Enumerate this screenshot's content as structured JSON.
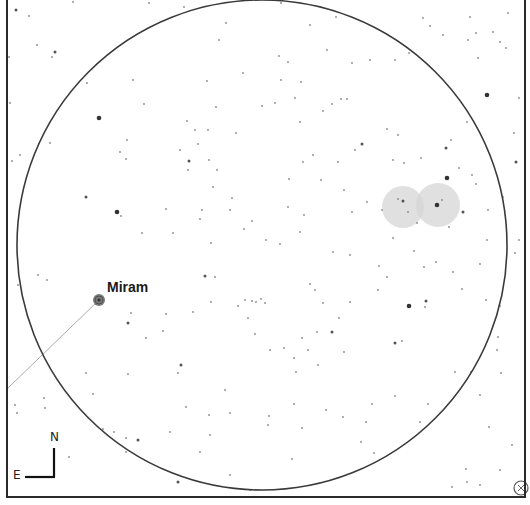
{
  "chart": {
    "width": 530,
    "height": 505,
    "frame": {
      "left": 7,
      "top": -2,
      "right": 525,
      "bottom": 497,
      "color": "#2a2a2a"
    },
    "field_circle": {
      "cx": 262,
      "cy": 245,
      "r": 245,
      "color": "#3a3a3a"
    },
    "background": "#ffffff"
  },
  "labels": {
    "named_star": "Miram",
    "compass_north": "N",
    "compass_east": "E"
  },
  "named_star": {
    "name": "Miram",
    "x": 99,
    "y": 300,
    "r": 6,
    "label_x": 107,
    "label_y": 279
  },
  "pointer_line": {
    "x1": 99,
    "y1": 300,
    "x2": 8,
    "y2": 388,
    "color": "#aaaaaa"
  },
  "nebulae": [
    {
      "cx": 403,
      "cy": 207,
      "r": 21,
      "color": "#d6d6d6"
    },
    {
      "cx": 438,
      "cy": 205,
      "r": 22,
      "color": "#d6d6d6"
    }
  ],
  "compass": {
    "corner_x": 54,
    "corner_y": 477,
    "north_len": 29,
    "east_len": 29,
    "label_n_x": 50,
    "label_n_y": 430,
    "label_e_x": 13,
    "label_e_y": 468
  },
  "corner_icon": {
    "name": "crosshair-icon",
    "cx": 521,
    "cy": 488,
    "r": 7
  },
  "stars": [
    {
      "x": 16,
      "y": 10,
      "m": 2
    },
    {
      "x": 29,
      "y": 16,
      "m": 1
    },
    {
      "x": 73,
      "y": 2,
      "m": 1
    },
    {
      "x": 37,
      "y": 45,
      "m": 1
    },
    {
      "x": 55,
      "y": 52,
      "m": 2
    },
    {
      "x": 52,
      "y": 57,
      "m": 1
    },
    {
      "x": 9,
      "y": 57,
      "m": 1
    },
    {
      "x": 87,
      "y": 83,
      "m": 1
    },
    {
      "x": 10,
      "y": 103,
      "m": 1
    },
    {
      "x": 50,
      "y": 143,
      "m": 1
    },
    {
      "x": 20,
      "y": 155,
      "m": 1
    },
    {
      "x": 12,
      "y": 161,
      "m": 1
    },
    {
      "x": 99,
      "y": 118,
      "m": 3
    },
    {
      "x": 133,
      "y": 80,
      "m": 1
    },
    {
      "x": 144,
      "y": 104,
      "m": 1
    },
    {
      "x": 127,
      "y": 140,
      "m": 1
    },
    {
      "x": 120,
      "y": 152,
      "m": 1
    },
    {
      "x": 126,
      "y": 159,
      "m": 1
    },
    {
      "x": 117,
      "y": 212,
      "m": 3
    },
    {
      "x": 86,
      "y": 197,
      "m": 2
    },
    {
      "x": 121,
      "y": 216,
      "m": 1
    },
    {
      "x": 142,
      "y": 233,
      "m": 1
    },
    {
      "x": 166,
      "y": 209,
      "m": 1
    },
    {
      "x": 173,
      "y": 233,
      "m": 1
    },
    {
      "x": 187,
      "y": 121,
      "m": 1
    },
    {
      "x": 195,
      "y": 130,
      "m": 1
    },
    {
      "x": 180,
      "y": 150,
      "m": 1
    },
    {
      "x": 189,
      "y": 161,
      "m": 2
    },
    {
      "x": 198,
      "y": 144,
      "m": 1
    },
    {
      "x": 188,
      "y": 170,
      "m": 1
    },
    {
      "x": 209,
      "y": 160,
      "m": 1
    },
    {
      "x": 217,
      "y": 170,
      "m": 1
    },
    {
      "x": 213,
      "y": 187,
      "m": 1
    },
    {
      "x": 202,
      "y": 210,
      "m": 1
    },
    {
      "x": 230,
      "y": 210,
      "m": 1
    },
    {
      "x": 232,
      "y": 198,
      "m": 1
    },
    {
      "x": 200,
      "y": 219,
      "m": 1
    },
    {
      "x": 244,
      "y": 229,
      "m": 1
    },
    {
      "x": 211,
      "y": 243,
      "m": 1
    },
    {
      "x": 252,
      "y": 221,
      "m": 1
    },
    {
      "x": 266,
      "y": 240,
      "m": 1
    },
    {
      "x": 208,
      "y": 130,
      "m": 1
    },
    {
      "x": 236,
      "y": 133,
      "m": 1
    },
    {
      "x": 262,
      "y": 106,
      "m": 1
    },
    {
      "x": 275,
      "y": 103,
      "m": 1
    },
    {
      "x": 295,
      "y": 98,
      "m": 1
    },
    {
      "x": 301,
      "y": 82,
      "m": 1
    },
    {
      "x": 288,
      "y": 62,
      "m": 1
    },
    {
      "x": 279,
      "y": 56,
      "m": 1
    },
    {
      "x": 281,
      "y": 80,
      "m": 1
    },
    {
      "x": 300,
      "y": 122,
      "m": 1
    },
    {
      "x": 327,
      "y": 50,
      "m": 1
    },
    {
      "x": 341,
      "y": 99,
      "m": 1
    },
    {
      "x": 347,
      "y": 99,
      "m": 1
    },
    {
      "x": 323,
      "y": 111,
      "m": 1
    },
    {
      "x": 332,
      "y": 104,
      "m": 1
    },
    {
      "x": 313,
      "y": 155,
      "m": 1
    },
    {
      "x": 303,
      "y": 162,
      "m": 1
    },
    {
      "x": 355,
      "y": 150,
      "m": 1
    },
    {
      "x": 338,
      "y": 162,
      "m": 1
    },
    {
      "x": 321,
      "y": 180,
      "m": 1
    },
    {
      "x": 362,
      "y": 144,
      "m": 2
    },
    {
      "x": 387,
      "y": 129,
      "m": 1
    },
    {
      "x": 398,
      "y": 135,
      "m": 1
    },
    {
      "x": 393,
      "y": 160,
      "m": 1
    },
    {
      "x": 404,
      "y": 163,
      "m": 1
    },
    {
      "x": 421,
      "y": 158,
      "m": 1
    },
    {
      "x": 446,
      "y": 148,
      "m": 2
    },
    {
      "x": 447,
      "y": 178,
      "m": 3
    },
    {
      "x": 459,
      "y": 168,
      "m": 1
    },
    {
      "x": 487,
      "y": 95,
      "m": 3
    },
    {
      "x": 516,
      "y": 162,
      "m": 2
    },
    {
      "x": 472,
      "y": 175,
      "m": 1
    },
    {
      "x": 488,
      "y": 210,
      "m": 1
    },
    {
      "x": 476,
      "y": 184,
      "m": 1
    },
    {
      "x": 503,
      "y": 197,
      "m": 1
    },
    {
      "x": 352,
      "y": 63,
      "m": 1
    },
    {
      "x": 370,
      "y": 60,
      "m": 1
    },
    {
      "x": 395,
      "y": 60,
      "m": 1
    },
    {
      "x": 409,
      "y": 53,
      "m": 1
    },
    {
      "x": 423,
      "y": 18,
      "m": 1
    },
    {
      "x": 430,
      "y": 26,
      "m": 1
    },
    {
      "x": 443,
      "y": 35,
      "m": 1
    },
    {
      "x": 470,
      "y": 17,
      "m": 1
    },
    {
      "x": 468,
      "y": 40,
      "m": 1
    },
    {
      "x": 478,
      "y": 58,
      "m": 1
    },
    {
      "x": 500,
      "y": 42,
      "m": 1
    },
    {
      "x": 506,
      "y": 48,
      "m": 1
    },
    {
      "x": 508,
      "y": 13,
      "m": 1
    },
    {
      "x": 493,
      "y": 32,
      "m": 1
    },
    {
      "x": 476,
      "y": 33,
      "m": 1
    },
    {
      "x": 281,
      "y": 3,
      "m": 1
    },
    {
      "x": 310,
      "y": 25,
      "m": 1
    },
    {
      "x": 336,
      "y": 17,
      "m": 1
    },
    {
      "x": 184,
      "y": 7,
      "m": 1
    },
    {
      "x": 149,
      "y": 3,
      "m": 1
    },
    {
      "x": 207,
      "y": 81,
      "m": 1
    },
    {
      "x": 216,
      "y": 107,
      "m": 1
    },
    {
      "x": 243,
      "y": 73,
      "m": 1
    },
    {
      "x": 219,
      "y": 40,
      "m": 1
    },
    {
      "x": 226,
      "y": 23,
      "m": 1
    },
    {
      "x": 403,
      "y": 201,
      "m": 2
    },
    {
      "x": 408,
      "y": 212,
      "m": 1
    },
    {
      "x": 398,
      "y": 199,
      "m": 1
    },
    {
      "x": 437,
      "y": 205,
      "m": 3
    },
    {
      "x": 442,
      "y": 200,
      "m": 1
    },
    {
      "x": 463,
      "y": 212,
      "m": 2
    },
    {
      "x": 449,
      "y": 227,
      "m": 1
    },
    {
      "x": 417,
      "y": 223,
      "m": 1
    },
    {
      "x": 382,
      "y": 210,
      "m": 1
    },
    {
      "x": 367,
      "y": 202,
      "m": 1
    },
    {
      "x": 352,
      "y": 212,
      "m": 1
    },
    {
      "x": 344,
      "y": 190,
      "m": 1
    },
    {
      "x": 304,
      "y": 215,
      "m": 1
    },
    {
      "x": 288,
      "y": 207,
      "m": 1
    },
    {
      "x": 289,
      "y": 179,
      "m": 1
    },
    {
      "x": 300,
      "y": 232,
      "m": 1
    },
    {
      "x": 280,
      "y": 244,
      "m": 1
    },
    {
      "x": 393,
      "y": 238,
      "m": 1
    },
    {
      "x": 414,
      "y": 251,
      "m": 1
    },
    {
      "x": 424,
      "y": 267,
      "m": 1
    },
    {
      "x": 436,
      "y": 262,
      "m": 1
    },
    {
      "x": 453,
      "y": 272,
      "m": 1
    },
    {
      "x": 462,
      "y": 289,
      "m": 1
    },
    {
      "x": 480,
      "y": 264,
      "m": 1
    },
    {
      "x": 487,
      "y": 240,
      "m": 1
    },
    {
      "x": 409,
      "y": 306,
      "m": 3
    },
    {
      "x": 426,
      "y": 301,
      "m": 2
    },
    {
      "x": 425,
      "y": 307,
      "m": 1
    },
    {
      "x": 395,
      "y": 343,
      "m": 2
    },
    {
      "x": 402,
      "y": 341,
      "m": 1
    },
    {
      "x": 387,
      "y": 277,
      "m": 1
    },
    {
      "x": 379,
      "y": 266,
      "m": 1
    },
    {
      "x": 378,
      "y": 290,
      "m": 1
    },
    {
      "x": 350,
      "y": 255,
      "m": 1
    },
    {
      "x": 333,
      "y": 252,
      "m": 1
    },
    {
      "x": 310,
      "y": 284,
      "m": 1
    },
    {
      "x": 315,
      "y": 290,
      "m": 1
    },
    {
      "x": 323,
      "y": 303,
      "m": 1
    },
    {
      "x": 332,
      "y": 332,
      "m": 2
    },
    {
      "x": 317,
      "y": 332,
      "m": 1
    },
    {
      "x": 302,
      "y": 338,
      "m": 1
    },
    {
      "x": 308,
      "y": 350,
      "m": 1
    },
    {
      "x": 294,
      "y": 358,
      "m": 1
    },
    {
      "x": 284,
      "y": 348,
      "m": 1
    },
    {
      "x": 296,
      "y": 372,
      "m": 1
    },
    {
      "x": 318,
      "y": 365,
      "m": 1
    },
    {
      "x": 344,
      "y": 352,
      "m": 1
    },
    {
      "x": 350,
      "y": 302,
      "m": 1
    },
    {
      "x": 339,
      "y": 318,
      "m": 1
    },
    {
      "x": 270,
      "y": 350,
      "m": 1
    },
    {
      "x": 245,
      "y": 300,
      "m": 1
    },
    {
      "x": 252,
      "y": 301,
      "m": 1
    },
    {
      "x": 256,
      "y": 302,
      "m": 1
    },
    {
      "x": 261,
      "y": 299,
      "m": 1
    },
    {
      "x": 265,
      "y": 303,
      "m": 1
    },
    {
      "x": 238,
      "y": 306,
      "m": 1
    },
    {
      "x": 248,
      "y": 318,
      "m": 1
    },
    {
      "x": 255,
      "y": 334,
      "m": 1
    },
    {
      "x": 215,
      "y": 277,
      "m": 1
    },
    {
      "x": 205,
      "y": 276,
      "m": 2
    },
    {
      "x": 211,
      "y": 302,
      "m": 1
    },
    {
      "x": 193,
      "y": 312,
      "m": 1
    },
    {
      "x": 166,
      "y": 314,
      "m": 1
    },
    {
      "x": 131,
      "y": 313,
      "m": 1
    },
    {
      "x": 128,
      "y": 323,
      "m": 2
    },
    {
      "x": 163,
      "y": 331,
      "m": 1
    },
    {
      "x": 146,
      "y": 338,
      "m": 1
    },
    {
      "x": 181,
      "y": 365,
      "m": 2
    },
    {
      "x": 178,
      "y": 373,
      "m": 1
    },
    {
      "x": 128,
      "y": 374,
      "m": 1
    },
    {
      "x": 93,
      "y": 394,
      "m": 1
    },
    {
      "x": 86,
      "y": 373,
      "m": 1
    },
    {
      "x": 44,
      "y": 398,
      "m": 1
    },
    {
      "x": 47,
      "y": 280,
      "m": 1
    },
    {
      "x": 38,
      "y": 275,
      "m": 1
    },
    {
      "x": 18,
      "y": 285,
      "m": 1
    },
    {
      "x": 15,
      "y": 405,
      "m": 1
    },
    {
      "x": 17,
      "y": 413,
      "m": 1
    },
    {
      "x": 45,
      "y": 408,
      "m": 1
    },
    {
      "x": 103,
      "y": 429,
      "m": 1
    },
    {
      "x": 114,
      "y": 432,
      "m": 1
    },
    {
      "x": 126,
      "y": 438,
      "m": 1
    },
    {
      "x": 138,
      "y": 440,
      "m": 2
    },
    {
      "x": 126,
      "y": 452,
      "m": 1
    },
    {
      "x": 69,
      "y": 457,
      "m": 1
    },
    {
      "x": 178,
      "y": 482,
      "m": 2
    },
    {
      "x": 210,
      "y": 435,
      "m": 1
    },
    {
      "x": 225,
      "y": 390,
      "m": 1
    },
    {
      "x": 230,
      "y": 413,
      "m": 1
    },
    {
      "x": 209,
      "y": 415,
      "m": 1
    },
    {
      "x": 186,
      "y": 407,
      "m": 1
    },
    {
      "x": 170,
      "y": 432,
      "m": 1
    },
    {
      "x": 200,
      "y": 452,
      "m": 1
    },
    {
      "x": 294,
      "y": 404,
      "m": 1
    },
    {
      "x": 302,
      "y": 428,
      "m": 1
    },
    {
      "x": 292,
      "y": 459,
      "m": 1
    },
    {
      "x": 268,
      "y": 425,
      "m": 1
    },
    {
      "x": 269,
      "y": 416,
      "m": 1
    },
    {
      "x": 230,
      "y": 475,
      "m": 1
    },
    {
      "x": 250,
      "y": 490,
      "m": 1
    },
    {
      "x": 326,
      "y": 410,
      "m": 1
    },
    {
      "x": 343,
      "y": 417,
      "m": 1
    },
    {
      "x": 366,
      "y": 422,
      "m": 1
    },
    {
      "x": 361,
      "y": 442,
      "m": 1
    },
    {
      "x": 374,
      "y": 453,
      "m": 1
    },
    {
      "x": 372,
      "y": 404,
      "m": 1
    },
    {
      "x": 395,
      "y": 396,
      "m": 1
    },
    {
      "x": 428,
      "y": 404,
      "m": 1
    },
    {
      "x": 420,
      "y": 422,
      "m": 1
    },
    {
      "x": 455,
      "y": 372,
      "m": 1
    },
    {
      "x": 471,
      "y": 372,
      "m": 1
    },
    {
      "x": 480,
      "y": 395,
      "m": 1
    },
    {
      "x": 501,
      "y": 373,
      "m": 1
    },
    {
      "x": 497,
      "y": 350,
      "m": 1
    },
    {
      "x": 498,
      "y": 337,
      "m": 1
    },
    {
      "x": 500,
      "y": 306,
      "m": 1
    },
    {
      "x": 486,
      "y": 300,
      "m": 1
    },
    {
      "x": 489,
      "y": 427,
      "m": 1
    },
    {
      "x": 512,
      "y": 445,
      "m": 1
    },
    {
      "x": 500,
      "y": 470,
      "m": 1
    },
    {
      "x": 466,
      "y": 469,
      "m": 1
    },
    {
      "x": 467,
      "y": 482,
      "m": 1
    },
    {
      "x": 480,
      "y": 485,
      "m": 1
    },
    {
      "x": 452,
      "y": 487,
      "m": 1
    },
    {
      "x": 515,
      "y": 253,
      "m": 1
    },
    {
      "x": 519,
      "y": 240,
      "m": 1
    },
    {
      "x": 519,
      "y": 98,
      "m": 1
    },
    {
      "x": 514,
      "y": 133,
      "m": 1
    },
    {
      "x": 467,
      "y": 122,
      "m": 1
    },
    {
      "x": 451,
      "y": 140,
      "m": 1
    }
  ]
}
